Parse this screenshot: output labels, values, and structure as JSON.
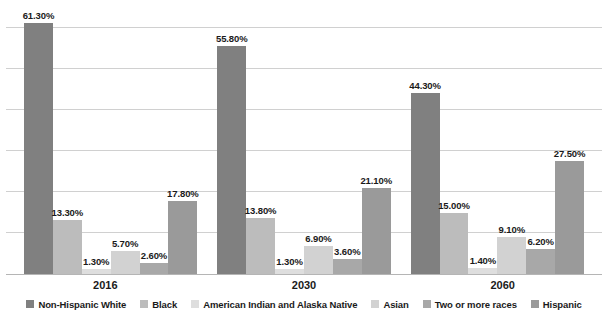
{
  "chart_data": {
    "type": "bar",
    "title": "",
    "subtitle": "",
    "xlabel": "",
    "ylabel": "",
    "categories": [
      "2016",
      "2030",
      "2060"
    ],
    "ylim": [
      0,
      65
    ],
    "grid": true,
    "gridlines": [
      10,
      20,
      30,
      40,
      50,
      60
    ],
    "legend_position": "bottom",
    "value_suffix": "%",
    "series": [
      {
        "name": "Non-Hispanic White",
        "color": "#808080",
        "values": [
          61.3,
          55.8,
          44.3
        ],
        "labels": [
          "61.30%",
          "55.80%",
          "44.30%"
        ]
      },
      {
        "name": "Black",
        "color": "#bcbcbc",
        "values": [
          13.3,
          13.8,
          15.0
        ],
        "labels": [
          "13.30%",
          "13.80%",
          "15.00%"
        ]
      },
      {
        "name": "American Indian and Alaska Native",
        "color": "#dedede",
        "values": [
          1.3,
          1.3,
          1.4
        ],
        "labels": [
          "1.30%",
          "1.30%",
          "1.40%"
        ]
      },
      {
        "name": "Asian",
        "color": "#d2d2d2",
        "values": [
          5.7,
          6.9,
          9.1
        ],
        "labels": [
          "5.70%",
          "6.90%",
          "9.10%"
        ]
      },
      {
        "name": "Two or more races",
        "color": "#a8a8a8",
        "values": [
          2.6,
          3.6,
          6.2
        ],
        "labels": [
          "2.60%",
          "3.60%",
          "6.20%"
        ]
      },
      {
        "name": "Hispanic",
        "color": "#9a9a9a",
        "values": [
          17.8,
          21.1,
          27.5
        ],
        "labels": [
          "17.80%",
          "21.10%",
          "27.50%"
        ]
      }
    ]
  },
  "legend": {
    "items": [
      {
        "label": "Non-Hispanic White",
        "color": "#808080"
      },
      {
        "label": "Black",
        "color": "#bcbcbc"
      },
      {
        "label": "American Indian and Alaska Native",
        "color": "#dedede"
      },
      {
        "label": "Asian",
        "color": "#d2d2d2"
      },
      {
        "label": "Two or more races",
        "color": "#a8a8a8"
      },
      {
        "label": "Hispanic",
        "color": "#9a9a9a"
      }
    ]
  },
  "axis": {
    "x_ticks": [
      "2016",
      "2030",
      "2060"
    ]
  },
  "colors": {
    "background": "#ffffff",
    "gridline": "#d0d0d0",
    "baseline": "#b5b5b5",
    "text": "#1a1a1a"
  }
}
